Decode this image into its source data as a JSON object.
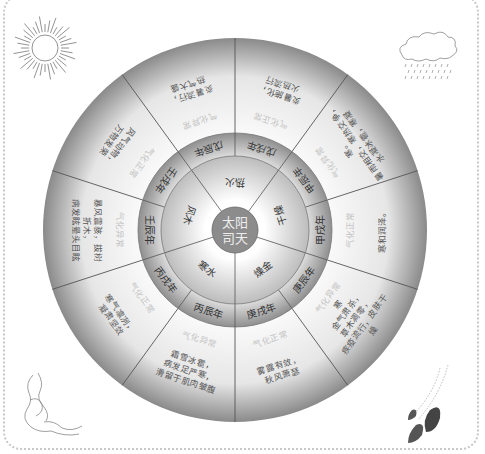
{
  "center": {
    "line1": "太阳",
    "line2": "司天",
    "label": "太阳司天"
  },
  "inner_ring": [
    {
      "text": "寒水"
    },
    {
      "text": "风木"
    },
    {
      "text": "热火"
    },
    {
      "text": "干燥"
    },
    {
      "text": "燥金"
    }
  ],
  "year_ring": [
    {
      "text": "戊戌年"
    },
    {
      "text": "甲辰年"
    },
    {
      "text": "甲戌年"
    },
    {
      "text": "庚辰年"
    },
    {
      "text": "庚戌年"
    },
    {
      "text": "丙辰年"
    },
    {
      "text": "丙戌年"
    },
    {
      "text": "壬辰年"
    },
    {
      "text": "壬戌年"
    },
    {
      "text": "戊辰年"
    }
  ],
  "outer_ring": [
    {
      "label": "气化正常",
      "text": [
        "炎暑施化，",
        "火热流行"
      ]
    },
    {
      "label": "气化异常",
      "text": [
        "寒。",
        "暑雨相交，寒热交争，",
        "水凝冰雹，寒凝"
      ]
    },
    {
      "label": "气化正常",
      "text": [
        "寒和润泽。"
      ]
    },
    {
      "label": "气化异常",
      "text": [
        "寒",
        "金气肃杀，",
        "草木凋零，",
        "疾疫流行，皮肤干",
        "燥"
      ]
    },
    {
      "label": "气化正常",
      "text": [
        "雾露有敛，",
        "秋风萧瑟"
      ]
    },
    {
      "label": "气化异常",
      "text": [
        "霜雪冰雹，",
        "病发足严寒，",
        "滑留于肌肉皱腹"
      ]
    },
    {
      "label": "气化正常",
      "text": [
        "寒气凛冽，",
        "凝肃坚敛"
      ]
    },
    {
      "label": "气化异常",
      "text": [
        "暴风震骇，拔树",
        "折木，",
        "病发眩晕头目眩"
      ]
    },
    {
      "label": "气化正常",
      "text": [
        "风气动物，",
        "万物发荣"
      ]
    },
    {
      "label": "气化异常",
      "text": [
        "炎暑流行，",
        "热气大盛"
      ]
    }
  ],
  "decorations": {
    "top_left": "sun-illustration",
    "top_right": "rain-cloud-illustration",
    "bottom_left": "wind-swirl-illustration",
    "bottom_right": "falling-leaves-illustration"
  },
  "colors": {
    "outer_light": "#fbfbfb",
    "outer_dark": "#8a8a8a",
    "ring_dark": "#8f8f8f",
    "center_fill": "#8c8c8c",
    "divider": "#555555"
  }
}
